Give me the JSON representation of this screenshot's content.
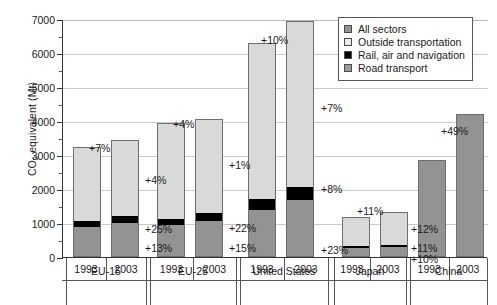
{
  "chart_data": {
    "type": "bar",
    "title": "",
    "xlabel": "",
    "ylabel": "CO2 equivalent (Mt)",
    "ylabel_parts": {
      "pre": "CO",
      "sub": "2",
      "post": " equivalent (Mt)"
    },
    "ylim": [
      0,
      7000
    ],
    "ytick_values": [
      0,
      1000,
      2000,
      3000,
      4000,
      5000,
      6000,
      7000
    ],
    "ytick_labels": [
      "0",
      "1000",
      "2000",
      "3000",
      "4000",
      "5000",
      "6000",
      "7000"
    ],
    "grid": true,
    "legend_position": "top-right",
    "legend": [
      {
        "label": "All sectors",
        "swatch": "sw-all",
        "color": "#939393"
      },
      {
        "label": "Outside transportation",
        "swatch": "sw-outside",
        "color": "#ededed"
      },
      {
        "label": "Rail, air and navigation",
        "swatch": "sw-rail",
        "color": "#000000"
      },
      {
        "label": "Road transport",
        "swatch": "sw-road",
        "color": "#9b9b9b"
      }
    ],
    "categories": [
      "EU-15",
      "EU-25",
      "United States",
      "Japan",
      "China"
    ],
    "years": [
      "1993",
      "2003"
    ],
    "groups": [
      {
        "name": "EU-15",
        "stacked": true,
        "bars": [
          {
            "year": "1993",
            "total": 3230,
            "road": 850,
            "rail": 180,
            "outside": 2200
          },
          {
            "year": "2003",
            "total": 3450,
            "road": 960,
            "rail": 225,
            "outside": 2265
          }
        ],
        "annotations": {
          "total": "+7%",
          "outside": "+4%",
          "rail": "+25%",
          "road": "+13%"
        }
      },
      {
        "name": "EU-25",
        "stacked": true,
        "bars": [
          {
            "year": "1993",
            "total": 3930,
            "road": 905,
            "rail": 190,
            "outside": 2835
          },
          {
            "year": "2003",
            "total": 4070,
            "road": 1040,
            "rail": 232,
            "outside": 2798
          }
        ],
        "annotations": {
          "total": "+4%",
          "outside": "+1%",
          "rail": "+22%",
          "road": "+15%"
        }
      },
      {
        "name": "United States",
        "stacked": true,
        "bars": [
          {
            "year": "1993",
            "total": 6280,
            "road": 1350,
            "rail": 330,
            "outside": 4600
          },
          {
            "year": "2003",
            "total": 6930,
            "road": 1660,
            "rail": 360,
            "outside": 4910
          }
        ],
        "annotations": {
          "total": "+10%",
          "outside": "+7%",
          "rail": "+8%",
          "road": "+23%"
        }
      },
      {
        "name": "Japan",
        "stacked": true,
        "bars": [
          {
            "year": "1993",
            "total": 1190,
            "road": 240,
            "rail": 60,
            "outside": 890
          },
          {
            "year": "2003",
            "total": 1320,
            "road": 265,
            "rail": 66,
            "outside": 989
          }
        ],
        "annotations": {
          "total": "+11%",
          "outside": "+12%",
          "rail": "+11%",
          "road": "+10%"
        }
      },
      {
        "name": "China",
        "stacked": false,
        "bars": [
          {
            "year": "1993",
            "total": 2840
          },
          {
            "year": "2003",
            "total": 4220
          }
        ],
        "annotations": {
          "total": "+49%"
        }
      }
    ]
  }
}
